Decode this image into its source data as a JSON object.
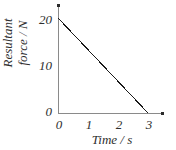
{
  "chart_data": {
    "type": "line",
    "title": "",
    "subtitle": "",
    "xlabel": "Time / s",
    "ylabel": "Resultant force / N",
    "ylabel_line1": "Resultant",
    "ylabel_line2": "force / N",
    "x": [
      0,
      3
    ],
    "values": [
      20,
      0
    ],
    "series": [
      {
        "name": "Resultant force",
        "x": [
          0,
          3
        ],
        "values": [
          20,
          0
        ],
        "color": "#1a1a1a"
      }
    ],
    "xlim": [
      0,
      3
    ],
    "ylim": [
      0,
      20
    ],
    "xticks": [
      "0",
      "1",
      "2",
      "3"
    ],
    "yticks": [
      "0",
      "10",
      "20"
    ],
    "xtick_values": [
      0,
      1,
      2,
      3
    ],
    "ytick_values": [
      0,
      10,
      20
    ],
    "grid": false,
    "legend": false,
    "axis_arrows": true,
    "annotations": []
  },
  "axes": {
    "x_title": "Time / s",
    "y_title_line1": "Resultant",
    "y_title_line2": "force / N",
    "y_tick_20": "20",
    "y_tick_10": "10",
    "y_tick_0": "0",
    "x_tick_0": "0",
    "x_tick_1": "1",
    "x_tick_2": "2",
    "x_tick_3": "3"
  },
  "colors": {
    "axis": "#8a8a8a",
    "line": "#1a1a1a",
    "text": "#2e2e2e",
    "background": "#ffffff"
  }
}
